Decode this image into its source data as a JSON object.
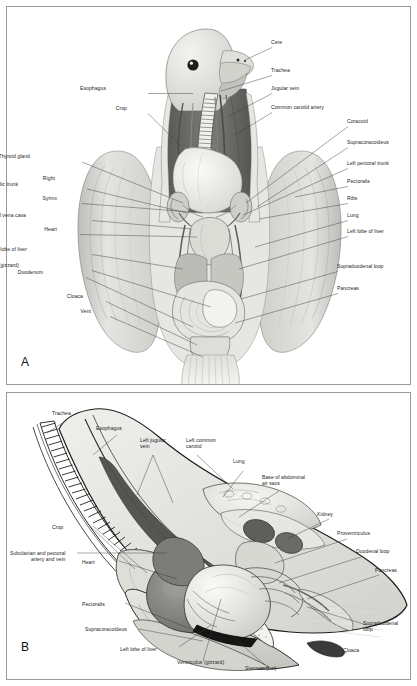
{
  "figure": {
    "panels": [
      {
        "letter": "A",
        "view": "ventral-view-opened-body-cavity",
        "labels_left": [
          {
            "text": "Esophagus",
            "x": 106,
            "y": 88
          },
          {
            "text": "Crop",
            "x": 127,
            "y": 108
          },
          {
            "text": "Thyroid gland",
            "x": 30,
            "y": 156
          },
          {
            "text": "Right",
            "x": 55,
            "y": 178
          },
          {
            "text": "brachiocephalic trunk",
            "x": 18,
            "y": 184
          },
          {
            "text": "Syrinx",
            "x": 57,
            "y": 198
          },
          {
            "text": "Caudal vena cava",
            "x": 26,
            "y": 215
          },
          {
            "text": "Heart",
            "x": 57,
            "y": 229
          },
          {
            "text": "Right lobe of liver",
            "x": 27,
            "y": 249
          },
          {
            "text": "Ventriculus (gizzard)",
            "x": 19,
            "y": 265
          },
          {
            "text": "Duodenum",
            "x": 43,
            "y": 272
          },
          {
            "text": "Cloaca",
            "x": 83,
            "y": 296
          },
          {
            "text": "Vent",
            "x": 91,
            "y": 311
          }
        ],
        "labels_right": [
          {
            "text": "Cere",
            "x": 271,
            "y": 42
          },
          {
            "text": "Trachea",
            "x": 271,
            "y": 70
          },
          {
            "text": "Jugular vein",
            "x": 271,
            "y": 88
          },
          {
            "text": "Common carotid artery",
            "x": 271,
            "y": 107
          },
          {
            "text": "Coracoid",
            "x": 347,
            "y": 121
          },
          {
            "text": "Supracoracoideus",
            "x": 347,
            "y": 142
          },
          {
            "text": "Left pectoral trunk",
            "x": 347,
            "y": 163
          },
          {
            "text": "Pectoralis",
            "x": 347,
            "y": 181
          },
          {
            "text": "Ribs",
            "x": 347,
            "y": 198
          },
          {
            "text": "Lung",
            "x": 347,
            "y": 215
          },
          {
            "text": "Left lobe of liver",
            "x": 347,
            "y": 231
          },
          {
            "text": "Supraduodenal loop",
            "x": 337,
            "y": 266
          },
          {
            "text": "Pancreas",
            "x": 337,
            "y": 288
          }
        ]
      },
      {
        "letter": "B",
        "view": "left-lateral-view-body-wall-removed",
        "labels": [
          {
            "text": "Trachea",
            "x": 52,
            "y": 413,
            "align": "left"
          },
          {
            "text": "Esophagus",
            "x": 96,
            "y": 428,
            "align": "left"
          },
          {
            "text": "Left jugular",
            "x": 140,
            "y": 440,
            "align": "left"
          },
          {
            "text": "vein",
            "x": 140,
            "y": 446,
            "align": "left"
          },
          {
            "text": "Left common",
            "x": 186,
            "y": 440,
            "align": "left"
          },
          {
            "text": "carotid",
            "x": 186,
            "y": 446,
            "align": "left"
          },
          {
            "text": "Lung",
            "x": 233,
            "y": 461,
            "align": "left"
          },
          {
            "text": "Base of abdominal",
            "x": 262,
            "y": 477,
            "align": "left"
          },
          {
            "text": "air sacs",
            "x": 262,
            "y": 483,
            "align": "left"
          },
          {
            "text": "Kidney",
            "x": 317,
            "y": 514,
            "align": "left"
          },
          {
            "text": "Proventriculus",
            "x": 337,
            "y": 533,
            "align": "left"
          },
          {
            "text": "Duodenal loop",
            "x": 356,
            "y": 551,
            "align": "left"
          },
          {
            "text": "Pancreas",
            "x": 375,
            "y": 570,
            "align": "left"
          },
          {
            "text": "Supraduodenal",
            "x": 363,
            "y": 623,
            "align": "left"
          },
          {
            "text": "loop",
            "x": 363,
            "y": 629,
            "align": "left"
          },
          {
            "text": "Cloaca",
            "x": 343,
            "y": 650,
            "align": "left"
          },
          {
            "text": "Ventriculus (gizzard)",
            "x": 177,
            "y": 662,
            "align": "left"
          },
          {
            "text": "Sternum (cut)",
            "x": 245,
            "y": 668,
            "align": "left"
          },
          {
            "text": "Left lobe of liver",
            "x": 120,
            "y": 649,
            "align": "left"
          },
          {
            "text": "Supracoracoideus",
            "x": 85,
            "y": 629,
            "align": "left"
          },
          {
            "text": "Pectoralis",
            "x": 82,
            "y": 604,
            "align": "left"
          },
          {
            "text": "Heart",
            "x": 82,
            "y": 562,
            "align": "left"
          },
          {
            "text": "Subclavian and pectoral",
            "x": 10,
            "y": 553,
            "align": "left"
          },
          {
            "text": "artery and vein",
            "x": 31,
            "y": 559,
            "align": "left"
          },
          {
            "text": "Crop",
            "x": 52,
            "y": 527,
            "align": "left"
          }
        ]
      }
    ]
  },
  "colors": {
    "border": "#9a9a9a",
    "background": "#ffffff",
    "leader": "#3a3a3a",
    "text": "#1b1b1b",
    "tissue_light": "#e9e9e6",
    "tissue_mid": "#c9c9c5",
    "tissue_dark": "#8d8d8a",
    "organ_dark": "#6e6e6b",
    "organ_darkest": "#3f3f3e"
  }
}
